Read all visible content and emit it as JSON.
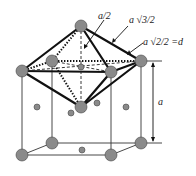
{
  "diagram": {
    "labels": {
      "half_a": "a/2",
      "a_sqrt3_over_2": "a √3/2",
      "a_sqrt2_over_2_eq_d": "a √2/2 =d",
      "lattice_param": "a"
    },
    "colors": {
      "atom_fill": "#8a8a8a",
      "line": "#111111",
      "background": "#ffffff"
    }
  }
}
